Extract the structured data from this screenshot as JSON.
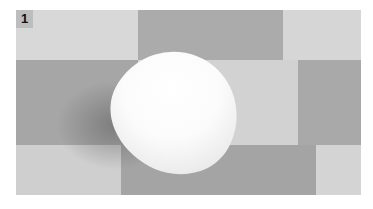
{
  "figure": {
    "panel_label": "1",
    "colors": {
      "light_tile": "#d6d6d6",
      "dark_tile": "#a8a8a8",
      "object": "#ffffff"
    }
  }
}
